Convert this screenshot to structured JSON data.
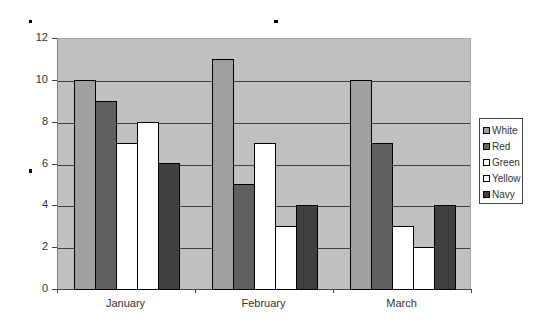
{
  "chart_data": {
    "type": "bar",
    "title": "",
    "xlabel": "",
    "ylabel": "",
    "ylim": [
      0,
      12
    ],
    "yticks": [
      0,
      2,
      4,
      6,
      8,
      10,
      12
    ],
    "grid": true,
    "legend_position": "right",
    "categories": [
      "January",
      "February",
      "March"
    ],
    "series": [
      {
        "name": "White",
        "color": "#a0a0a0",
        "values": [
          10,
          11,
          10
        ]
      },
      {
        "name": "Red",
        "color": "#606060",
        "values": [
          9,
          5,
          7
        ]
      },
      {
        "name": "Green",
        "color": "#ffffff",
        "values": [
          7,
          7,
          3
        ]
      },
      {
        "name": "Yellow",
        "color": "#ffffff",
        "values": [
          8,
          3,
          2
        ]
      },
      {
        "name": "Navy",
        "color": "#404040",
        "values": [
          6,
          4,
          4
        ]
      }
    ]
  },
  "colors": {
    "plot_background": "#c0c0c0",
    "gridline": "#404040"
  }
}
